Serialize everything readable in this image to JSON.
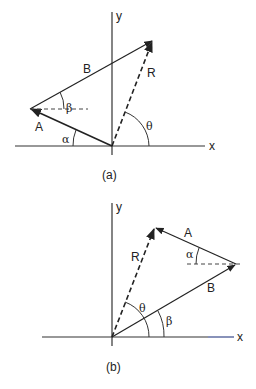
{
  "figures": [
    {
      "caption": "(a)",
      "axes": {
        "x_label": "x",
        "y_label": "y"
      },
      "vectors": [
        {
          "name": "A",
          "label": "A",
          "style": "solid",
          "angle_label": "α",
          "angle_ref": "x-axis (negative direction)"
        },
        {
          "name": "B",
          "label": "B",
          "style": "solid",
          "angle_label": "β",
          "angle_ref": "horizontal dashed reference at tip of A"
        },
        {
          "name": "R",
          "label": "R",
          "style": "dashed",
          "angle_label": "θ",
          "angle_ref": "positive x-axis"
        }
      ],
      "labels": {
        "A": "A",
        "B": "B",
        "R": "R",
        "alpha": "α",
        "beta": "β",
        "theta": "θ"
      }
    },
    {
      "caption": "(b)",
      "axes": {
        "x_label": "x",
        "y_label": "y"
      },
      "vectors": [
        {
          "name": "B",
          "label": "B",
          "style": "solid",
          "angle_label": "β",
          "angle_ref": "positive x-axis"
        },
        {
          "name": "A",
          "label": "A",
          "style": "solid",
          "angle_label": "α",
          "angle_ref": "horizontal dashed reference at tip of B"
        },
        {
          "name": "R",
          "label": "R",
          "style": "dashed",
          "angle_label": "θ",
          "angle_ref": "positive x-axis"
        }
      ],
      "labels": {
        "A": "A",
        "B": "B",
        "R": "R",
        "alpha": "α",
        "beta": "β",
        "theta": "θ"
      }
    }
  ],
  "colors": {
    "line": "#222222",
    "background": "#ffffff",
    "x_axis_tail_b": "#3a4a8a"
  }
}
